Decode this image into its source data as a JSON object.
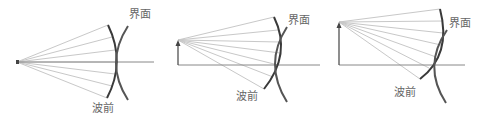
{
  "diagram": {
    "colors": {
      "ray": "#c8c8c8",
      "axis": "#888888",
      "wavefront": "#3a3a3a",
      "interface": "#555555",
      "label": "#666666",
      "object": "#444444"
    },
    "panels": [
      {
        "id": "panel-1",
        "object": "point-source",
        "interface_label": "界面",
        "wavefront_label": "波前"
      },
      {
        "id": "panel-2",
        "object": "short-arrow",
        "interface_label": "界面",
        "wavefront_label": "波前"
      },
      {
        "id": "panel-3",
        "object": "tall-arrow",
        "interface_label": "界面",
        "wavefront_label": "波前"
      }
    ]
  }
}
